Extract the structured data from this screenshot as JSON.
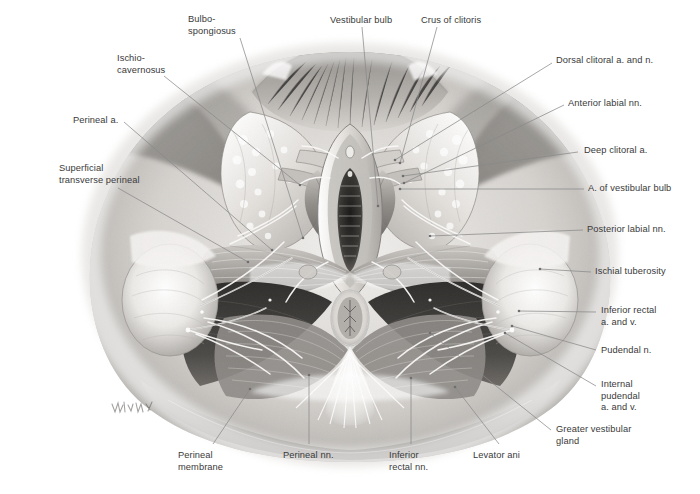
{
  "figure": {
    "kind": "anatomical-illustration",
    "style": "grayscale medical illustration",
    "signature": "illegible artist signature, lower left of drawing",
    "colors": {
      "background": "#ffffff",
      "label_text": "#3a3a3a",
      "leader_line": "#8a8a8a",
      "tissue_light": "#e8e6e3",
      "tissue_mid": "#b9b6b2",
      "tissue_dark": "#6f6c69",
      "cavity_dark": "#3b3936",
      "shadow": "#9a9894"
    }
  },
  "labels": [
    {
      "id": "bulbospongiosus",
      "text": "Bulbo-\nspongiosus",
      "x": 188,
      "y": 14,
      "align": "left",
      "lx": 240,
      "ly": 38,
      "tx": 303,
      "ty": 238
    },
    {
      "id": "vestibular-bulb",
      "text": "Vestibular bulb",
      "x": 330,
      "y": 15,
      "align": "left",
      "lx": 362,
      "ly": 27,
      "tx": 378,
      "ty": 206
    },
    {
      "id": "crus-of-clitoris",
      "text": "Crus of clitoris",
      "x": 421,
      "y": 15,
      "align": "left",
      "lx": 437,
      "ly": 27,
      "tx": 400,
      "ty": 163
    },
    {
      "id": "ischiocavernosus",
      "text": "Ischio-\ncavernosus",
      "x": 117,
      "y": 53,
      "align": "left",
      "lx": 164,
      "ly": 76,
      "tx": 300,
      "ty": 185
    },
    {
      "id": "dorsal-clitoral-an",
      "text": "Dorsal clitoral a. and n.",
      "x": 556,
      "y": 55,
      "align": "left",
      "lx": 552,
      "ly": 63,
      "tx": 395,
      "ty": 160
    },
    {
      "id": "perineal-a",
      "text": "Perineal a.",
      "x": 73,
      "y": 115,
      "align": "left",
      "lx": 124,
      "ly": 122,
      "tx": 272,
      "ty": 250
    },
    {
      "id": "anterior-labial-nn",
      "text": "Anterior labial nn.",
      "x": 568,
      "y": 98,
      "align": "left",
      "lx": 564,
      "ly": 105,
      "tx": 404,
      "ty": 183
    },
    {
      "id": "superficial-transverse",
      "text": "Superficial\ntransverse perineal",
      "x": 59,
      "y": 163,
      "align": "left",
      "lx": 118,
      "ly": 188,
      "tx": 248,
      "ty": 262
    },
    {
      "id": "deep-clitoral-a",
      "text": "Deep clitoral a.",
      "x": 584,
      "y": 145,
      "align": "left",
      "lx": 578,
      "ly": 152,
      "tx": 403,
      "ty": 176
    },
    {
      "id": "a-of-vestibular-bulb",
      "text": "A. of vestibular bulb",
      "x": 588,
      "y": 183,
      "align": "left",
      "lx": 584,
      "ly": 189,
      "tx": 400,
      "ty": 189
    },
    {
      "id": "posterior-labial-nn",
      "text": "Posterior labial nn.",
      "x": 587,
      "y": 224,
      "align": "left",
      "lx": 583,
      "ly": 230,
      "tx": 430,
      "ty": 236
    },
    {
      "id": "ischial-tuberosity",
      "text": "Ischial tuberosity",
      "x": 595,
      "y": 266,
      "align": "left",
      "lx": 591,
      "ly": 272,
      "tx": 540,
      "ty": 269
    },
    {
      "id": "inferior-rectal-av",
      "text": "Inferior rectal\na. and v.",
      "x": 601,
      "y": 305,
      "align": "left",
      "lx": 596,
      "ly": 312,
      "tx": 519,
      "ty": 311
    },
    {
      "id": "pudendal-n",
      "text": "Pudendal n.",
      "x": 601,
      "y": 345,
      "align": "left",
      "lx": 596,
      "ly": 350,
      "tx": 512,
      "ty": 326
    },
    {
      "id": "internal-pudendal-av",
      "text": "Internal\npudendal\na. and v.",
      "x": 601,
      "y": 379,
      "align": "left",
      "lx": 596,
      "ly": 386,
      "tx": 505,
      "ty": 333
    },
    {
      "id": "greater-vestibular",
      "text": "Greater vestibular\ngland",
      "x": 556,
      "y": 424,
      "align": "left",
      "lx": 551,
      "ly": 430,
      "tx": 430,
      "ty": 333
    },
    {
      "id": "perineal-membrane",
      "text": "Perineal\nmembrane",
      "x": 178,
      "y": 450,
      "align": "left",
      "lx": 213,
      "ly": 444,
      "tx": 250,
      "ty": 389
    },
    {
      "id": "perineal-nn",
      "text": "Perineal nn.",
      "x": 283,
      "y": 450,
      "align": "left",
      "lx": 309,
      "ly": 444,
      "tx": 309,
      "ty": 375
    },
    {
      "id": "inferior-rectal-nn",
      "text": "Inferior\nrectal nn.",
      "x": 389,
      "y": 450,
      "align": "left",
      "lx": 411,
      "ly": 444,
      "tx": 411,
      "ty": 378
    },
    {
      "id": "levator-ani",
      "text": "Levator ani",
      "x": 473,
      "y": 450,
      "align": "left",
      "lx": 499,
      "ly": 444,
      "tx": 455,
      "ty": 387
    }
  ]
}
